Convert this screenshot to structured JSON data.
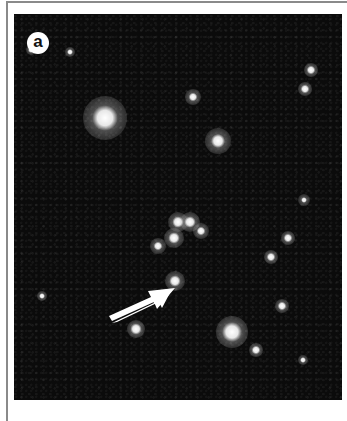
{
  "figure": {
    "panel_label": "a",
    "colors": {
      "background": "#0b0b0b",
      "star": "#ffffff",
      "arrow": "#ffffff",
      "frame": "#8a8a8a"
    },
    "stars": [
      {
        "x": 105,
        "y": 118,
        "r": 9,
        "glow": 22
      },
      {
        "x": 218,
        "y": 141,
        "r": 5,
        "glow": 13
      },
      {
        "x": 193,
        "y": 97,
        "r": 3,
        "glow": 8
      },
      {
        "x": 174,
        "y": 238,
        "r": 4,
        "glow": 10
      },
      {
        "x": 178,
        "y": 222,
        "r": 4,
        "glow": 10
      },
      {
        "x": 190,
        "y": 222,
        "r": 4,
        "glow": 10
      },
      {
        "x": 201,
        "y": 231,
        "r": 3,
        "glow": 8
      },
      {
        "x": 158,
        "y": 246,
        "r": 3,
        "glow": 8
      },
      {
        "x": 175,
        "y": 281,
        "r": 4,
        "glow": 10
      },
      {
        "x": 232,
        "y": 332,
        "r": 7,
        "glow": 16
      },
      {
        "x": 136,
        "y": 329,
        "r": 4,
        "glow": 9
      },
      {
        "x": 311,
        "y": 70,
        "r": 3,
        "glow": 7
      },
      {
        "x": 305,
        "y": 89,
        "r": 3,
        "glow": 7
      },
      {
        "x": 304,
        "y": 200,
        "r": 2,
        "glow": 6
      },
      {
        "x": 288,
        "y": 238,
        "r": 3,
        "glow": 7
      },
      {
        "x": 271,
        "y": 257,
        "r": 3,
        "glow": 7
      },
      {
        "x": 256,
        "y": 350,
        "r": 3,
        "glow": 7
      },
      {
        "x": 31,
        "y": 50,
        "r": 2,
        "glow": 5
      },
      {
        "x": 70,
        "y": 52,
        "r": 2,
        "glow": 5
      },
      {
        "x": 42,
        "y": 296,
        "r": 2,
        "glow": 5
      },
      {
        "x": 282,
        "y": 306,
        "r": 3,
        "glow": 7
      },
      {
        "x": 303,
        "y": 360,
        "r": 2,
        "glow": 5
      }
    ],
    "annotation": {
      "type": "arrow",
      "direction": "up-right",
      "target_x": 176,
      "target_y": 282
    },
    "caption_cropped": "(text cut off at bottom edge — illegible)"
  }
}
